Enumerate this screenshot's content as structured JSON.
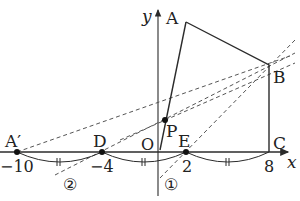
{
  "axes": {
    "x_label": "x",
    "y_label": "y",
    "origin_label": "O"
  },
  "points": {
    "A": "A",
    "A_prime": "A′",
    "B": "B",
    "C": "C",
    "D": "D",
    "E": "E",
    "P": "P"
  },
  "ticks": {
    "neg10": "−10",
    "neg4": "−4",
    "two": "2",
    "eight": "8"
  },
  "line_markers": {
    "one": "①",
    "two": "②"
  },
  "colors": {
    "stroke": "#2b2b2b",
    "dashed": "#555555",
    "background": "#ffffff"
  }
}
